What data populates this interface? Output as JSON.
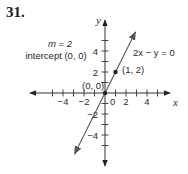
{
  "problem_number": "31.",
  "annotations": {
    "slope": "m = 2",
    "intercept": "intercept (0, 0)",
    "equation": "2x − y = 0",
    "point_label": "(1, 2)",
    "origin_label": "(0, 0)"
  },
  "chart_data": {
    "type": "line",
    "title": "",
    "xlabel": "x",
    "ylabel": "y",
    "xlim": [
      -6,
      6
    ],
    "ylim": [
      -6,
      6
    ],
    "x_ticks": [
      -5,
      -4,
      -3,
      -2,
      -1,
      1,
      2,
      3,
      4,
      5
    ],
    "y_ticks": [
      -5,
      -4,
      -3,
      -2,
      -1,
      1,
      2,
      3,
      4,
      5
    ],
    "x_tick_labels": [
      {
        "value": -4,
        "text": "−4"
      },
      {
        "value": -2,
        "text": "−2"
      },
      {
        "value": 0,
        "text": "0"
      },
      {
        "value": 2,
        "text": "2"
      },
      {
        "value": 4,
        "text": "4"
      }
    ],
    "y_tick_labels": [
      {
        "value": 4,
        "text": "4"
      },
      {
        "value": 2,
        "text": "2"
      },
      {
        "value": -2,
        "text": "−2"
      },
      {
        "value": -4,
        "text": "−4"
      }
    ],
    "grid": false,
    "series": [
      {
        "name": "2x - y = 0",
        "slope": 2,
        "intercept": 0,
        "x_range": [
          -2.9,
          2.9
        ]
      }
    ],
    "points": [
      {
        "x": 1,
        "y": 2,
        "label": "(1, 2)"
      },
      {
        "x": 0,
        "y": 0,
        "label": "(0, 0)"
      }
    ]
  }
}
